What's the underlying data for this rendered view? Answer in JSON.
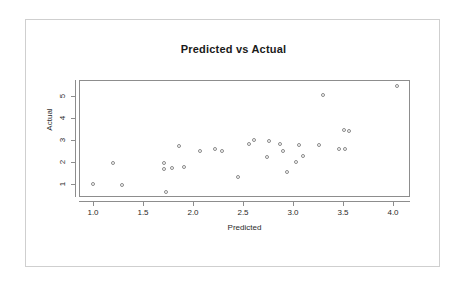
{
  "figure": {
    "background_color": "#ffffff",
    "frame_color": "#cfcfcf",
    "axis_color": "#8d8d8d",
    "point_color": "#8a8a8a"
  },
  "chart_data": {
    "type": "scatter",
    "title": "Predicted vs Actual",
    "xlabel": "Predicted",
    "ylabel": "Actual",
    "xlim": [
      0.86,
      4.17
    ],
    "ylim": [
      0.42,
      5.71
    ],
    "xticks": [
      "1.0",
      "1.5",
      "2.0",
      "2.5",
      "3.0",
      "3.5",
      "4.0"
    ],
    "xtick_values": [
      1.0,
      1.5,
      2.0,
      2.5,
      3.0,
      3.5,
      4.0
    ],
    "yticks": [
      "1",
      "2",
      "3",
      "4",
      "5"
    ],
    "ytick_values": [
      1,
      2,
      3,
      4,
      5
    ],
    "grid": false,
    "legend": null,
    "marker": "open-circle",
    "points": [
      {
        "x": 0.99,
        "y": 1.05
      },
      {
        "x": 1.19,
        "y": 2.02
      },
      {
        "x": 1.28,
        "y": 1.03
      },
      {
        "x": 1.7,
        "y": 1.72
      },
      {
        "x": 1.7,
        "y": 1.99
      },
      {
        "x": 1.72,
        "y": 0.7
      },
      {
        "x": 1.78,
        "y": 1.78
      },
      {
        "x": 1.85,
        "y": 2.77
      },
      {
        "x": 1.9,
        "y": 1.81
      },
      {
        "x": 2.06,
        "y": 2.55
      },
      {
        "x": 2.21,
        "y": 2.65
      },
      {
        "x": 2.28,
        "y": 2.55
      },
      {
        "x": 2.44,
        "y": 1.36
      },
      {
        "x": 2.55,
        "y": 2.86
      },
      {
        "x": 2.6,
        "y": 3.04
      },
      {
        "x": 2.73,
        "y": 2.28
      },
      {
        "x": 2.75,
        "y": 3.0
      },
      {
        "x": 2.86,
        "y": 2.86
      },
      {
        "x": 2.89,
        "y": 2.53
      },
      {
        "x": 2.93,
        "y": 1.62
      },
      {
        "x": 3.02,
        "y": 2.03
      },
      {
        "x": 3.05,
        "y": 2.82
      },
      {
        "x": 3.09,
        "y": 2.32
      },
      {
        "x": 3.25,
        "y": 2.83
      },
      {
        "x": 3.29,
        "y": 5.07
      },
      {
        "x": 3.45,
        "y": 2.64
      },
      {
        "x": 3.51,
        "y": 2.63
      },
      {
        "x": 3.5,
        "y": 3.5
      },
      {
        "x": 3.55,
        "y": 3.44
      },
      {
        "x": 4.03,
        "y": 5.5
      }
    ]
  }
}
